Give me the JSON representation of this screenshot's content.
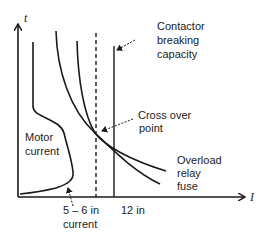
{
  "diagram": {
    "axes": {
      "y_label": "t",
      "x_label": "I"
    },
    "labels": {
      "contactor": [
        "Contactor",
        "breaking",
        "capacity"
      ],
      "crossover": [
        "Cross over",
        "point"
      ],
      "motor": [
        "Motor",
        "current"
      ],
      "overload": [
        "Overload",
        "relay",
        "fuse"
      ],
      "tick_5_6": [
        "5 – 6 in",
        "current"
      ],
      "tick_12": "12 in"
    },
    "colors": {
      "line": "#1a1a1a",
      "text": "#222222",
      "background": "#ffffff"
    }
  }
}
